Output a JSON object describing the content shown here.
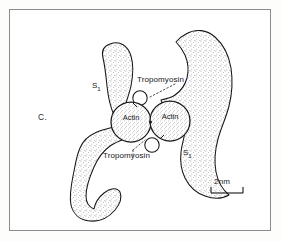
{
  "figure": {
    "panel_label": "C.",
    "caption_items": {
      "tropomyosin_top": "Tropomyosin",
      "tropomyosin_bottom": "Tropomyosin",
      "s1_left": "S",
      "s1_left_sub": "1",
      "s1_right": "S",
      "s1_right_sub": "1",
      "actin_left": "Actin",
      "actin_right": "Actin"
    },
    "scale_bar": {
      "label": "2nm",
      "value": 2,
      "unit": "nm"
    },
    "style": {
      "ink": "#17171a",
      "frame": "#8a8a86",
      "stipple": "#5c5c60",
      "background": "#ffffff"
    },
    "elements": {
      "myosin_head_left": "S1 myosin subfragment (left)",
      "myosin_head_right": "S1 myosin subfragment (right)",
      "actin_monomer_left": "actin monomer (left)",
      "actin_monomer_right": "actin monomer (right)",
      "tropomyosin_circle_top": "tropomyosin strand cross-section (top)",
      "tropomyosin_circle_bottom": "tropomyosin strand cross-section (bottom)"
    }
  }
}
